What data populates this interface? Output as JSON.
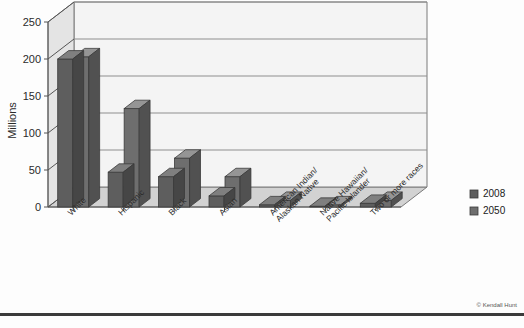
{
  "chart_data": {
    "type": "bar",
    "title": "",
    "xlabel": "",
    "ylabel": "Millions",
    "ylim": [
      0,
      250
    ],
    "yticks": [
      0,
      50,
      100,
      150,
      200,
      250
    ],
    "grid": true,
    "legend_position": "right",
    "categories": [
      "White",
      "Hispanic",
      "Black",
      "Asian",
      "American Indian/\nAlaskan Native",
      "Native Hawaiian/\nPacific Islander",
      "Two or more races"
    ],
    "series": [
      {
        "name": "2008",
        "color": "#5e5e5e",
        "values": [
          200,
          47,
          41,
          15,
          3,
          1,
          5
        ]
      },
      {
        "name": "2050",
        "color": "#6e6e6e",
        "values": [
          203,
          133,
          66,
          41,
          9,
          3,
          9
        ]
      }
    ]
  },
  "legend": {
    "items": [
      {
        "label": "2008",
        "color": "#5e5e5e"
      },
      {
        "label": "2050",
        "color": "#6e6e6e"
      }
    ]
  },
  "axis": {
    "y_title": "Millions",
    "y_ticks": [
      "0",
      "50",
      "100",
      "150",
      "200",
      "250"
    ]
  },
  "footer": {
    "credit": "© Kendall Hunt"
  }
}
